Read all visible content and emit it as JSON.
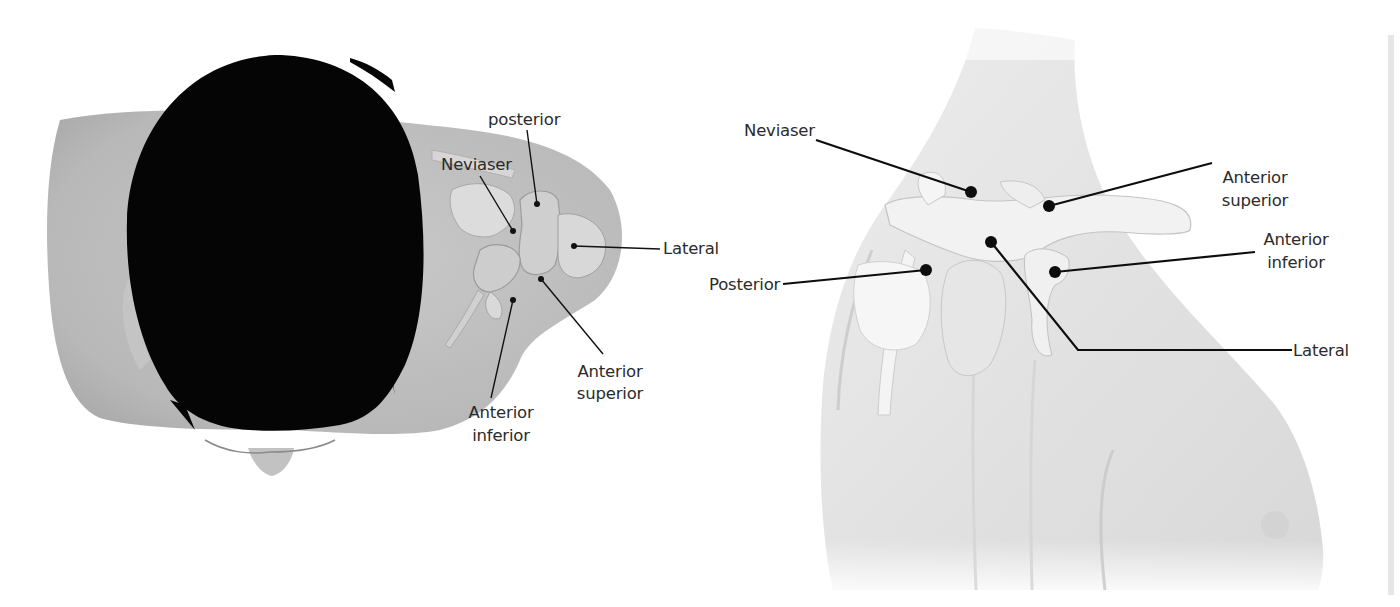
{
  "colors": {
    "background": "#ffffff",
    "skin_left": "#bdbdbd",
    "skin_right": "#e6e6e6",
    "hair": "#050505",
    "label_text": "#2b2b2b",
    "leader_line": "#111111",
    "page_edge": "#e4e4e4"
  },
  "left_figure": {
    "view": "superior view of head and shoulder",
    "labels": {
      "posterior": "posterior",
      "neviaser": "Neviaser",
      "lateral": "Lateral",
      "anterior_superior_line1": "Anterior",
      "anterior_superior_line2": "superior",
      "anterior_inferior_line1": "Anterior",
      "anterior_inferior_line2": "inferior"
    }
  },
  "right_figure": {
    "view": "posterior oblique view of shoulder",
    "labels": {
      "neviaser": "Neviaser",
      "posterior": "Posterior",
      "anterior_superior_line1": "Anterior",
      "anterior_superior_line2": "superior",
      "anterior_inferior_line1": "Anterior",
      "anterior_inferior_line2": "inferior",
      "lateral": "Lateral"
    }
  }
}
